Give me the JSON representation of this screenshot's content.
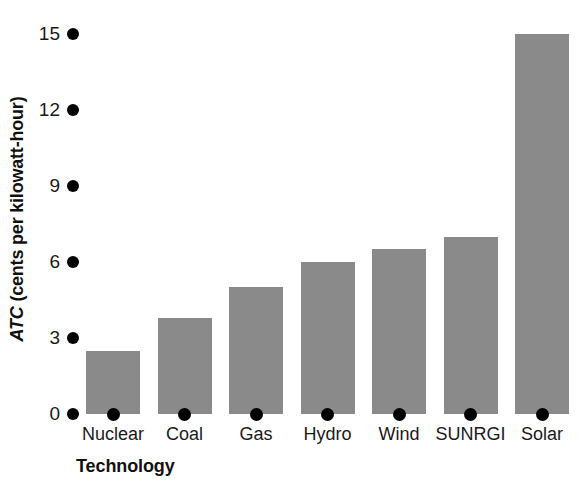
{
  "chart_data": {
    "type": "bar",
    "title": "",
    "xlabel": "Technology",
    "ylabel": "ATC (cents per kilowatt-hour)",
    "ylabel_parts": {
      "abbr": "ATC",
      "rest": " (cents per kilowatt-hour)"
    },
    "categories": [
      "Nuclear",
      "Coal",
      "Gas",
      "Hydro",
      "Wind",
      "SUNRGI",
      "Solar"
    ],
    "values": [
      2.5,
      3.8,
      5.0,
      6.0,
      6.5,
      7.0,
      15.0
    ],
    "ylim": [
      0,
      15
    ],
    "yticks": [
      0,
      3,
      6,
      9,
      12,
      15
    ],
    "ytick_labels": [
      "0",
      "3",
      "6",
      "9",
      "12",
      "15"
    ],
    "grid": false,
    "legend": false,
    "bar_color": "#8a8a8a",
    "tick_marker_color": "#000000",
    "text_color": "#111111",
    "background_color": "#ffffff"
  }
}
